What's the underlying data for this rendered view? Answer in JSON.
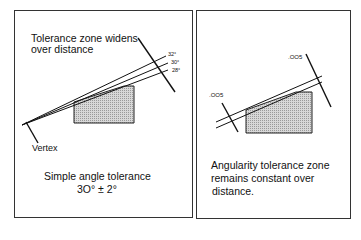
{
  "left_panel": {
    "heading_line1": "Tolerance zone widens",
    "heading_line2": "over distance",
    "angle_labels": [
      "32°",
      "30°",
      "28°"
    ],
    "vertex_label": "Vertex",
    "caption_line1": "Simple angle tolerance",
    "caption_line2": "3O° ± 2°"
  },
  "right_panel": {
    "tolerance_label_left": ".OO5",
    "tolerance_label_right": ".OO5",
    "caption_line1": "Angularity tolerance  zone",
    "caption_line2": "remains constant over",
    "caption_line3": "distance."
  },
  "colors": {
    "line": "#111111",
    "frame": "#333333",
    "shade": "#c4c4c4"
  }
}
